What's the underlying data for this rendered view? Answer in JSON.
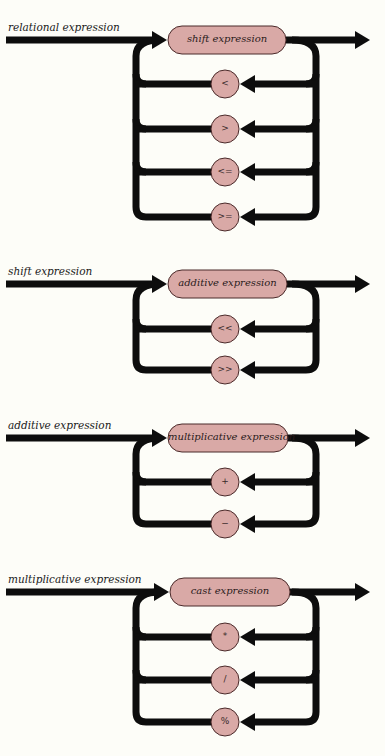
{
  "colors": {
    "line": "#0d0d0d",
    "node_fill": "#d9a9a6",
    "node_stroke": "#4a2a2a",
    "background": "#fdfdf8"
  },
  "diagrams": [
    {
      "title": "relational expression",
      "main_y": 40,
      "node_label": "shift expression",
      "node_x1": 168,
      "node_x2": 286,
      "operators": [
        {
          "symbol": "<",
          "y": 84
        },
        {
          "symbol": ">",
          "y": 129
        },
        {
          "symbol": "<=",
          "y": 172
        },
        {
          "symbol": ">=",
          "y": 217
        }
      ]
    },
    {
      "title": "shift expression",
      "main_y": 284,
      "node_label": "additive expression",
      "node_x1": 168,
      "node_x2": 287,
      "operators": [
        {
          "symbol": "<<",
          "y": 329
        },
        {
          "symbol": ">>",
          "y": 370
        }
      ]
    },
    {
      "title": "additive expression",
      "main_y": 438,
      "node_label": "multiplicative expression",
      "node_x1": 168,
      "node_x2": 288,
      "operators": [
        {
          "symbol": "+",
          "y": 482
        },
        {
          "symbol": "−",
          "y": 524
        }
      ]
    },
    {
      "title": "multiplicative expression",
      "main_y": 592,
      "node_label": "cast expression",
      "node_x1": 170,
      "node_x2": 290,
      "operators": [
        {
          "symbol": "*",
          "y": 637
        },
        {
          "symbol": "/",
          "y": 680
        },
        {
          "symbol": "%",
          "y": 722
        }
      ]
    }
  ]
}
